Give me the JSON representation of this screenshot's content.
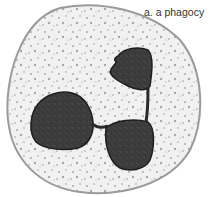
{
  "figure": {
    "caption": "a. a phagocy",
    "colors": {
      "background": "#ffffff",
      "cytoplasm": "#f1f1f1",
      "membrane": "#9a9a9a",
      "granules": "#a8a8a8",
      "nucleus": "#3a3a3a",
      "nucleus_outline": "#1e1e1e",
      "caption_text": "#333333"
    }
  }
}
